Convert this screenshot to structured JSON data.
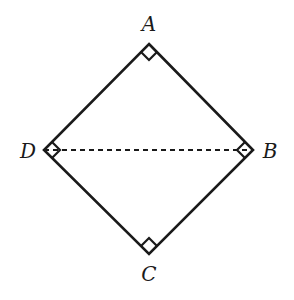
{
  "diagram": {
    "type": "geometry-square",
    "vertices": {
      "A": {
        "label": "A",
        "x": 149,
        "y": 44,
        "label_x": 149,
        "label_y": 31
      },
      "B": {
        "label": "B",
        "x": 253,
        "y": 150,
        "label_x": 270,
        "label_y": 158
      },
      "C": {
        "label": "C",
        "x": 149,
        "y": 254,
        "label_x": 149,
        "label_y": 281
      },
      "D": {
        "label": "D",
        "x": 44,
        "y": 150,
        "label_x": 28,
        "label_y": 158
      }
    },
    "edges": [
      [
        "A",
        "B"
      ],
      [
        "B",
        "C"
      ],
      [
        "C",
        "D"
      ],
      [
        "D",
        "A"
      ]
    ],
    "dashed_segments": [
      [
        "D",
        "B"
      ]
    ],
    "right_angle_marks": [
      "A",
      "B",
      "C",
      "D"
    ],
    "stroke_color": "#1a1a1a",
    "background_color": "#ffffff"
  }
}
